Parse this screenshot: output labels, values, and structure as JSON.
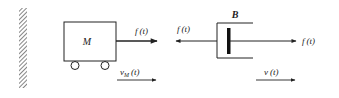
{
  "diagram": {
    "title": "",
    "wall": {
      "label": ""
    },
    "mass": {
      "label": "M"
    },
    "mass_force": {
      "label": "f(t)",
      "label_main": "f",
      "label_arg": "(t)",
      "direction": "right"
    },
    "mass_velocity": {
      "label_main": "v",
      "label_sub": "M",
      "label_arg": "(t)",
      "direction": "right"
    },
    "damper": {
      "label": "B"
    },
    "damper_force_left": {
      "label_main": "f",
      "label_arg": "(t)",
      "direction": "left"
    },
    "damper_force_right": {
      "label_main": "f",
      "label_arg": "(t)",
      "direction": "right"
    },
    "damper_velocity": {
      "label_main": "v",
      "label_arg": "(t)",
      "direction": "right"
    },
    "colors": {
      "ink": "#222222",
      "background": "#ffffff"
    }
  }
}
